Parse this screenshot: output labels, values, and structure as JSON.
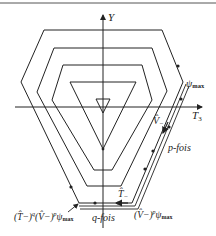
{
  "diagram": {
    "axes": {
      "y_label": "Y",
      "x_label": "T",
      "x_label_sub": "3"
    },
    "labels": {
      "psi_max": "ψ",
      "psi_max_sub": "max",
      "v_minus": "V̂",
      "v_minus_sub": "−",
      "p_fois": "p-fois",
      "t_minus": "T̂",
      "t_minus_sub": "−",
      "q_fois": "q-fois",
      "bottom_left_expr": "(T̂",
      "bottom_left_expr_rest": "−)",
      "bottom_left_q": "q",
      "bottom_left_v": "(V̂",
      "bottom_left_v_rest": "−)",
      "bottom_left_p": "p",
      "bottom_left_psi": "ψ",
      "bottom_left_psi_sub": "max",
      "bottom_right_v": "(V̂",
      "bottom_right_v_rest": "−)",
      "bottom_right_p": "p",
      "bottom_right_psi": "ψ",
      "bottom_right_psi_sub": "max"
    },
    "colors": {
      "line": "#222222",
      "background": "#ffffff"
    }
  }
}
